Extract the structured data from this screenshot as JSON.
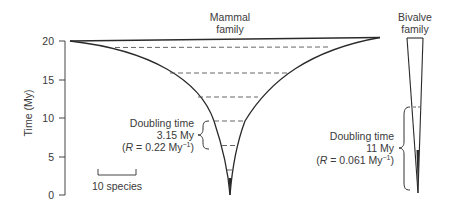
{
  "diagram": {
    "y_axis": {
      "label": "Time (My)",
      "ticks": [
        "20",
        "15",
        "10",
        "5",
        "0"
      ],
      "tick_values": [
        20,
        15,
        10,
        5,
        0
      ]
    },
    "mammal": {
      "title_line1": "Mammal",
      "title_line2": "family",
      "doubling_label": "Doubling time",
      "doubling_value": "3.15 My",
      "rate_prefix": "(",
      "rate_var": "R",
      "rate_eq": " = 0.22 My",
      "rate_exp": "−1",
      "rate_suffix": ")",
      "doubling_time_my": 3.15,
      "rate_per_my": 0.22
    },
    "bivalve": {
      "title_line1": "Bivalve",
      "title_line2": "family",
      "doubling_label": "Doubling time",
      "doubling_value": "11 My",
      "rate_prefix": "(",
      "rate_var": "R",
      "rate_eq": " = 0.061 My",
      "rate_exp": "−1",
      "rate_suffix": ")",
      "doubling_time_my": 11,
      "rate_per_my": 0.061
    },
    "scale_bar": {
      "label": "10 species"
    },
    "colors": {
      "line": "#2a2a2a",
      "text": "#3a3a3a",
      "background": "#ffffff"
    }
  }
}
